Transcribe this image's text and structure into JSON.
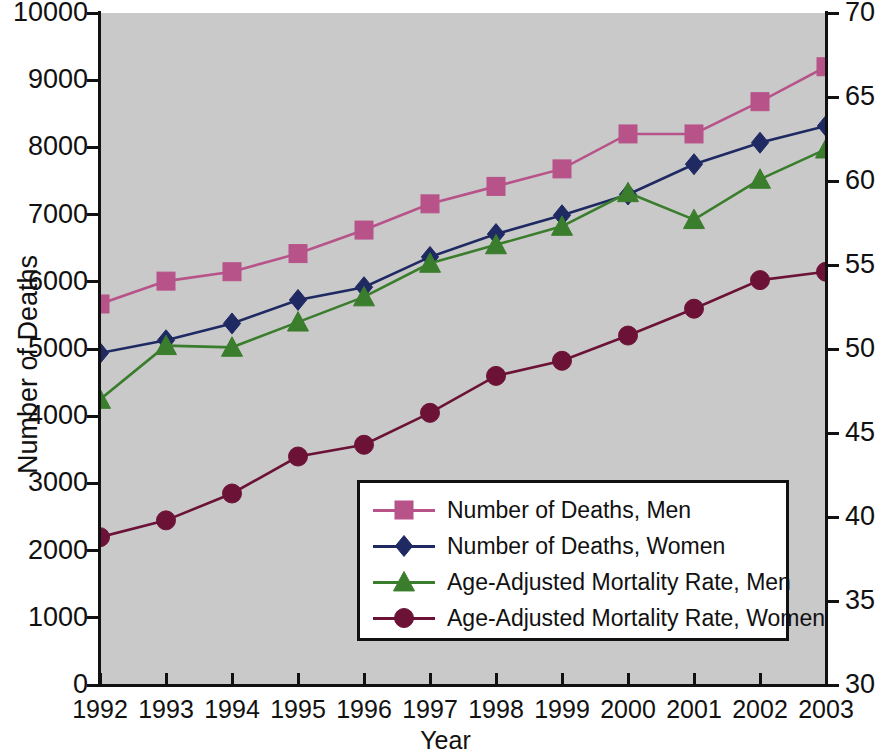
{
  "chart_data": {
    "type": "line",
    "title": "",
    "xlabel": "Year",
    "ylabel": "Number of Deaths",
    "y2label": "Mortality Rate per 1,000,000 Population",
    "grid": false,
    "legend_position": "center-right inside plot",
    "background_color": "#c9c9c9",
    "x": [
      1992,
      1993,
      1994,
      1995,
      1996,
      1997,
      1998,
      1999,
      2000,
      2001,
      2002,
      2003
    ],
    "categories": [
      "1992",
      "1993",
      "1994",
      "1995",
      "1996",
      "1997",
      "1998",
      "1999",
      "2000",
      "2001",
      "2002",
      "2003"
    ],
    "ylim": [
      0,
      10000
    ],
    "yticks": [
      0,
      1000,
      2000,
      3000,
      4000,
      5000,
      6000,
      7000,
      8000,
      9000,
      10000
    ],
    "yticklabels": [
      "0",
      "1000",
      "2000",
      "3000",
      "4000",
      "5000",
      "6000",
      "7000",
      "8000",
      "9000",
      "10000"
    ],
    "y2lim": [
      30,
      70
    ],
    "y2ticks": [
      30,
      35,
      40,
      45,
      50,
      55,
      60,
      65,
      70
    ],
    "y2ticklabels": [
      "30",
      "35",
      "40",
      "45",
      "50",
      "55",
      "60",
      "65",
      "70"
    ],
    "series": [
      {
        "name": "Number of Deaths, Men",
        "axis": "left",
        "color": "#b8538a",
        "line_color": "#b8538a",
        "marker": "square",
        "values": [
          5670,
          6010,
          6150,
          6420,
          6770,
          7160,
          7420,
          7680,
          8200,
          8200,
          8680,
          9200
        ]
      },
      {
        "name": "Number of Deaths, Women",
        "axis": "left",
        "color": "#1f2a63",
        "line_color": "#1f2a63",
        "marker": "diamond",
        "values": [
          4940,
          5130,
          5380,
          5730,
          5920,
          6370,
          6710,
          6990,
          7300,
          7750,
          8070,
          8320
        ]
      },
      {
        "name": "Age-Adjusted Mortality Rate, Men",
        "axis": "right",
        "color": "#3a7d2c",
        "line_color": "#3a7d2c",
        "marker": "triangle",
        "values": [
          47.0,
          50.2,
          50.1,
          51.6,
          53.1,
          55.1,
          56.2,
          57.3,
          59.3,
          57.7,
          60.1,
          61.9
        ]
      },
      {
        "name": "Age-Adjusted Mortality Rate, Women",
        "axis": "right",
        "color": "#6b1236",
        "line_color": "#6b1236",
        "marker": "circle",
        "values": [
          38.8,
          39.8,
          41.4,
          43.6,
          44.3,
          46.2,
          48.4,
          49.3,
          50.8,
          52.4,
          54.1,
          54.6
        ]
      }
    ]
  }
}
